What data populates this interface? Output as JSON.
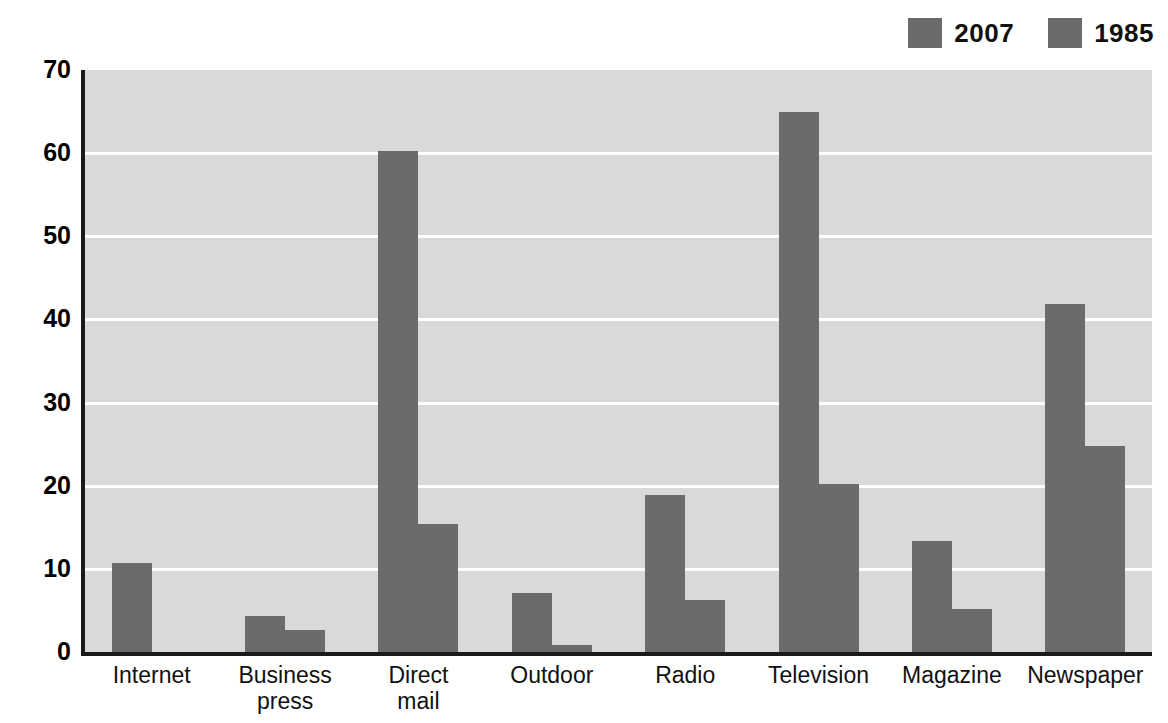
{
  "chart_data": {
    "type": "bar",
    "title": "",
    "xlabel": "",
    "ylabel": "Dollars (in billions)",
    "ylim": [
      0,
      70
    ],
    "ytick_step": 10,
    "yticks": [
      "70",
      "60",
      "50",
      "40",
      "30",
      "20",
      "10",
      "0"
    ],
    "grid": true,
    "legend_position": "top-right",
    "categories": [
      "Internet",
      "Business press",
      "Direct mail",
      "Outdoor",
      "Radio",
      "Television",
      "Magazine",
      "Newspaper"
    ],
    "category_lines": [
      [
        "Internet"
      ],
      [
        "Business",
        "press"
      ],
      [
        "Direct",
        "mail"
      ],
      [
        "Outdoor"
      ],
      [
        "Radio"
      ],
      [
        "Television"
      ],
      [
        "Magazine"
      ],
      [
        "Newspaper"
      ]
    ],
    "series": [
      {
        "name": "2007",
        "color": "#6b6b6b",
        "values": [
          10.7,
          4.3,
          60.2,
          7.1,
          18.9,
          65.0,
          13.3,
          41.8
        ]
      },
      {
        "name": "1985",
        "color": "#6b6b6b",
        "values": [
          0,
          2.6,
          15.4,
          0.8,
          6.2,
          20.2,
          5.2,
          24.8
        ]
      }
    ]
  },
  "legend": {
    "items": [
      {
        "label": "2007",
        "color": "#6b6b6b"
      },
      {
        "label": "1985",
        "color": "#6b6b6b"
      }
    ]
  },
  "colors": {
    "bar": "#6b6b6b",
    "plot_background": "#d9d9d9",
    "gridline": "#ffffff",
    "axis": "#1a1a1a",
    "page_background": "#ffffff",
    "text": "#111111"
  }
}
